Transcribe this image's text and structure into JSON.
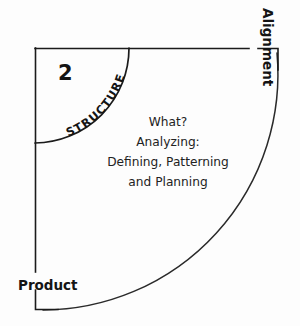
{
  "diagram": {
    "quadrant_number": "2",
    "arc_label": "STRUCTURE",
    "axis_labels": {
      "vertical_right": "Alignment",
      "horizontal_left": "Product"
    },
    "center_text_lines": [
      "What?",
      "Analyzing:",
      "Defining, Patterning",
      "and Planning"
    ],
    "colors": {
      "background": "#fdfdfd",
      "ink": "#1b1b1b",
      "body_text": "#222222",
      "arc": "#2a2a2a"
    }
  }
}
